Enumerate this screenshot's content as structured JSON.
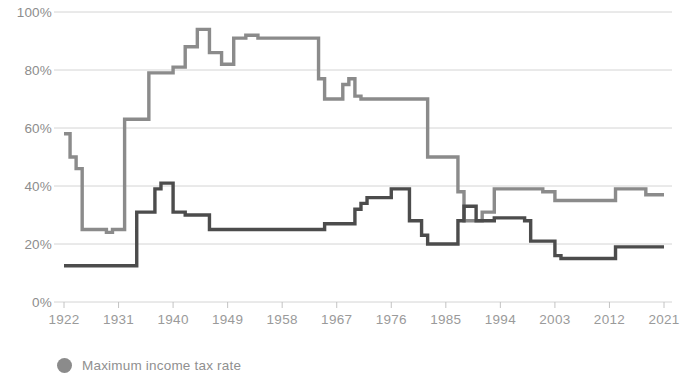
{
  "chart_data": {
    "type": "line",
    "title": "",
    "subtitle": "",
    "xlabel": "",
    "ylabel": "",
    "xlim": [
      1922,
      2021
    ],
    "ylim": [
      0,
      100
    ],
    "grid": true,
    "legend_position": "bottom-left",
    "y_ticks": [
      "0%",
      "20%",
      "40%",
      "60%",
      "80%",
      "100%"
    ],
    "y_tick_values": [
      0,
      20,
      40,
      60,
      80,
      100
    ],
    "x_ticks": [
      "1922",
      "1931",
      "1940",
      "1949",
      "1958",
      "1967",
      "1976",
      "1985",
      "1994",
      "2003",
      "2012",
      "2021"
    ],
    "x_tick_values": [
      1922,
      1931,
      1940,
      1949,
      1958,
      1967,
      1976,
      1985,
      1994,
      2003,
      2012,
      2021
    ],
    "series": [
      {
        "name": "Maximum income tax rate",
        "color": "#8b8b8b",
        "x": [
          1922,
          1923,
          1924,
          1925,
          1926,
          1927,
          1928,
          1929,
          1930,
          1931,
          1932,
          1933,
          1934,
          1935,
          1936,
          1937,
          1938,
          1939,
          1940,
          1941,
          1942,
          1943,
          1944,
          1945,
          1946,
          1947,
          1948,
          1949,
          1950,
          1951,
          1952,
          1953,
          1954,
          1955,
          1956,
          1957,
          1958,
          1959,
          1960,
          1961,
          1962,
          1963,
          1964,
          1965,
          1966,
          1967,
          1968,
          1969,
          1970,
          1971,
          1972,
          1973,
          1974,
          1975,
          1976,
          1977,
          1978,
          1979,
          1980,
          1981,
          1982,
          1983,
          1984,
          1985,
          1986,
          1987,
          1988,
          1989,
          1990,
          1991,
          1992,
          1993,
          1994,
          1995,
          1996,
          1997,
          1998,
          1999,
          2000,
          2001,
          2002,
          2003,
          2004,
          2005,
          2006,
          2007,
          2008,
          2009,
          2010,
          2011,
          2012,
          2013,
          2014,
          2015,
          2016,
          2017,
          2018,
          2019,
          2020
        ],
        "values": [
          58,
          50,
          46,
          25,
          25,
          25,
          25,
          24,
          25,
          25,
          63,
          63,
          63,
          63,
          79,
          79,
          79,
          79,
          81,
          81,
          88,
          88,
          94,
          94,
          86,
          86,
          82,
          82,
          91,
          91,
          92,
          92,
          91,
          91,
          91,
          91,
          91,
          91,
          91,
          91,
          91,
          91,
          77,
          70,
          70,
          70,
          75,
          77,
          71,
          70,
          70,
          70,
          70,
          70,
          70,
          70,
          70,
          70,
          70,
          70,
          50,
          50,
          50,
          50,
          50,
          38,
          28,
          28,
          28,
          31,
          31,
          39,
          39,
          39,
          39,
          39,
          39,
          39,
          39,
          38,
          38,
          35,
          35,
          35,
          35,
          35,
          35,
          35,
          35,
          35,
          35,
          39,
          39,
          39,
          39,
          39,
          37,
          37,
          37
        ]
      },
      {
        "name": "Maximum capital gains tax rate",
        "color": "#4c4c4c",
        "x": [
          1922,
          1923,
          1924,
          1925,
          1926,
          1927,
          1928,
          1929,
          1930,
          1931,
          1932,
          1933,
          1934,
          1935,
          1936,
          1937,
          1938,
          1939,
          1940,
          1941,
          1942,
          1943,
          1944,
          1945,
          1946,
          1947,
          1948,
          1949,
          1950,
          1951,
          1952,
          1953,
          1954,
          1955,
          1956,
          1957,
          1958,
          1959,
          1960,
          1961,
          1962,
          1963,
          1964,
          1965,
          1966,
          1967,
          1968,
          1969,
          1970,
          1971,
          1972,
          1973,
          1974,
          1975,
          1976,
          1977,
          1978,
          1979,
          1980,
          1981,
          1982,
          1983,
          1984,
          1985,
          1986,
          1987,
          1988,
          1989,
          1990,
          1991,
          1992,
          1993,
          1994,
          1995,
          1996,
          1997,
          1998,
          1999,
          2000,
          2001,
          2002,
          2003,
          2004,
          2005,
          2006,
          2007,
          2008,
          2009,
          2010,
          2011,
          2012,
          2013,
          2014,
          2015,
          2016,
          2017,
          2018,
          2019,
          2020
        ],
        "values": [
          12.5,
          12.5,
          12.5,
          12.5,
          12.5,
          12.5,
          12.5,
          12.5,
          12.5,
          12.5,
          12.5,
          12.5,
          31,
          31,
          31,
          39,
          41,
          41,
          31,
          31,
          30,
          30,
          30,
          30,
          25,
          25,
          25,
          25,
          25,
          25,
          25,
          25,
          25,
          25,
          25,
          25,
          25,
          25,
          25,
          25,
          25,
          25,
          25,
          27,
          27,
          27,
          27,
          27,
          32,
          34,
          36,
          36,
          36,
          36,
          39,
          39,
          39,
          28,
          28,
          23,
          20,
          20,
          20,
          20,
          20,
          28,
          33,
          33,
          28,
          28,
          28,
          29,
          29,
          29,
          29,
          29,
          28,
          21,
          21,
          21,
          21,
          16,
          15,
          15,
          15,
          15,
          15,
          15,
          15,
          15,
          15,
          19,
          19,
          19,
          19,
          19,
          19,
          19,
          19
        ]
      }
    ],
    "legend": [
      {
        "label": "Maximum income tax rate",
        "color": "#8b8b8b"
      }
    ]
  },
  "axis": {
    "y_title": "",
    "x_title": ""
  },
  "legend": {
    "entries": [
      {
        "label": "Maximum income tax rate"
      }
    ]
  }
}
